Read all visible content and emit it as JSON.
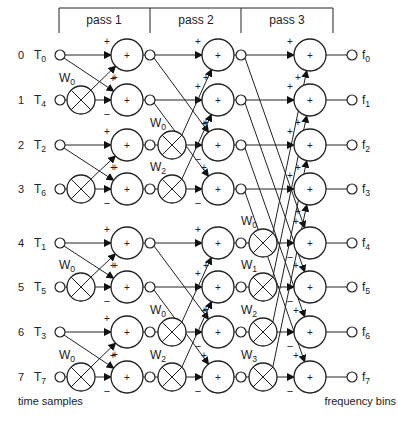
{
  "passes": [
    "pass 1",
    "pass 2",
    "pass 3"
  ],
  "inputs": [
    {
      "index": "0",
      "name": "T",
      "sub": "0"
    },
    {
      "index": "1",
      "name": "T",
      "sub": "4"
    },
    {
      "index": "2",
      "name": "T",
      "sub": "2"
    },
    {
      "index": "3",
      "name": "T",
      "sub": "6"
    },
    {
      "index": "4",
      "name": "T",
      "sub": "1"
    },
    {
      "index": "5",
      "name": "T",
      "sub": "5"
    },
    {
      "index": "6",
      "name": "T",
      "sub": "3"
    },
    {
      "index": "7",
      "name": "T",
      "sub": "7"
    }
  ],
  "outputs": [
    {
      "name": "f",
      "sub": "0"
    },
    {
      "name": "f",
      "sub": "1"
    },
    {
      "name": "f",
      "sub": "2"
    },
    {
      "name": "f",
      "sub": "3"
    },
    {
      "name": "f",
      "sub": "4"
    },
    {
      "name": "f",
      "sub": "5"
    },
    {
      "name": "f",
      "sub": "6"
    },
    {
      "name": "f",
      "sub": "7"
    }
  ],
  "stages": [
    {
      "span": 1,
      "multipliers": [
        {
          "row": 1,
          "label": "W",
          "sub": "0"
        },
        {
          "row": 3,
          "label": "",
          "sub": ""
        },
        {
          "row": 5,
          "label": "W",
          "sub": "0"
        },
        {
          "row": 7,
          "label": "W",
          "sub": "0"
        }
      ]
    },
    {
      "span": 2,
      "multipliers": [
        {
          "row": 2,
          "label": "W",
          "sub": "0"
        },
        {
          "row": 3,
          "label": "W",
          "sub": "2"
        },
        {
          "row": 6,
          "label": "W",
          "sub": "0"
        },
        {
          "row": 7,
          "label": "W",
          "sub": "2"
        }
      ]
    },
    {
      "span": 4,
      "multipliers": [
        {
          "row": 4,
          "label": "W",
          "sub": "0"
        },
        {
          "row": 5,
          "label": "W",
          "sub": "1"
        },
        {
          "row": 6,
          "label": "W",
          "sub": "2"
        },
        {
          "row": 7,
          "label": "W",
          "sub": "3"
        }
      ]
    }
  ],
  "signs": {
    "plus": "+",
    "minus": "−",
    "adder": "+"
  },
  "footer": {
    "left": "time samples",
    "right": "frequency bins"
  }
}
